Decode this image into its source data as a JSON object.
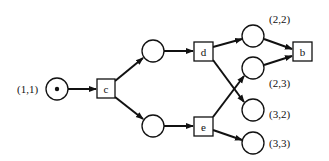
{
  "diagram": {
    "type": "petri-net",
    "places": [
      {
        "id": "p11",
        "label": "(1,1)",
        "token": true
      },
      {
        "id": "pu",
        "label": "",
        "token": false
      },
      {
        "id": "pl",
        "label": "",
        "token": false
      },
      {
        "id": "p22",
        "label": "(2,2)",
        "token": false
      },
      {
        "id": "p23",
        "label": "(2,3)",
        "token": false
      },
      {
        "id": "p32",
        "label": "(3,2)",
        "token": false
      },
      {
        "id": "p33",
        "label": "(3,3)",
        "token": false
      }
    ],
    "transitions": [
      {
        "id": "c",
        "label": "c"
      },
      {
        "id": "d",
        "label": "d"
      },
      {
        "id": "e",
        "label": "e"
      },
      {
        "id": "b",
        "label": "b"
      }
    ],
    "arcs": [
      {
        "from": "p11",
        "to": "c"
      },
      {
        "from": "c",
        "to": "pu"
      },
      {
        "from": "c",
        "to": "pl"
      },
      {
        "from": "pu",
        "to": "d"
      },
      {
        "from": "pl",
        "to": "e"
      },
      {
        "from": "d",
        "to": "p22"
      },
      {
        "from": "d",
        "to": "p32"
      },
      {
        "from": "e",
        "to": "p23"
      },
      {
        "from": "e",
        "to": "p33"
      },
      {
        "from": "p22",
        "to": "b"
      },
      {
        "from": "p23",
        "to": "b"
      }
    ]
  }
}
